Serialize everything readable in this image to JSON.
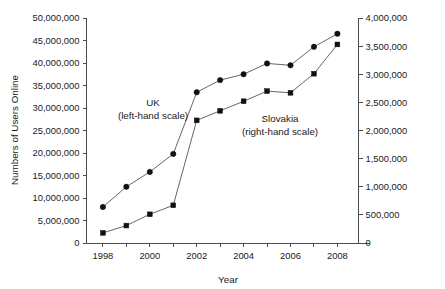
{
  "chart_data": {
    "type": "line",
    "title": "",
    "xlabel": "Year",
    "ylabel": "Numbers of Users Online",
    "y2label": "",
    "x": [
      1998,
      1999,
      2000,
      2001,
      2002,
      2003,
      2004,
      2005,
      2006,
      2007,
      2008
    ],
    "xtick_labels": [
      "1998",
      "2000",
      "2002",
      "2004",
      "2006",
      "2008"
    ],
    "xtick_values": [
      1998,
      2000,
      2002,
      2004,
      2006,
      2008
    ],
    "xlim": [
      1997.3,
      2008.9
    ],
    "ylim": [
      0,
      50000000
    ],
    "ytick_labels": [
      "50,000,000",
      "45,000,000",
      "40,000,000",
      "35,000,000",
      "30,000,000",
      "25,000,000",
      "20,000,000",
      "15,000,000",
      "10,000,000",
      "5,000,000",
      "0"
    ],
    "ytick_values": [
      50000000,
      45000000,
      40000000,
      35000000,
      30000000,
      25000000,
      20000000,
      15000000,
      10000000,
      5000000,
      0
    ],
    "y2lim": [
      0,
      4000000
    ],
    "y2tick_labels": [
      "4,000,000",
      "3,500,000",
      "3,000,000",
      "2,500,000",
      "2,000,000",
      "1,500,000",
      "1,000,000",
      "500,000",
      "0"
    ],
    "y2tick_values": [
      4000000,
      3500000,
      3000000,
      2500000,
      2000000,
      1500000,
      1000000,
      500000,
      0
    ],
    "grid": false,
    "legend_position": "inline-annotation",
    "series": [
      {
        "name": "UK",
        "axis": "left",
        "marker": "circle",
        "values": [
          8000000,
          12500000,
          15800000,
          19800000,
          33500000,
          36200000,
          37500000,
          39900000,
          39500000,
          43600000,
          46500000
        ]
      },
      {
        "name": "Slovakia",
        "axis": "right",
        "marker": "square",
        "values": [
          180000,
          310000,
          510000,
          670000,
          2180000,
          2350000,
          2520000,
          2700000,
          2670000,
          3010000,
          3530000
        ]
      }
    ],
    "annotations": [
      {
        "id": "uk-annotation",
        "line1": "UK",
        "line2": "(left-hand scale)",
        "x": 153,
        "y": 106
      },
      {
        "id": "slovakia-annotation",
        "line1": "Slovakia",
        "line2": "(right-hand scale)",
        "x": 280,
        "y": 122
      }
    ]
  },
  "colors": {
    "marker": "#111111",
    "line": "#555555",
    "axis": "#4d4d4d",
    "text": "#1a1a1a",
    "background": "#ffffff"
  }
}
